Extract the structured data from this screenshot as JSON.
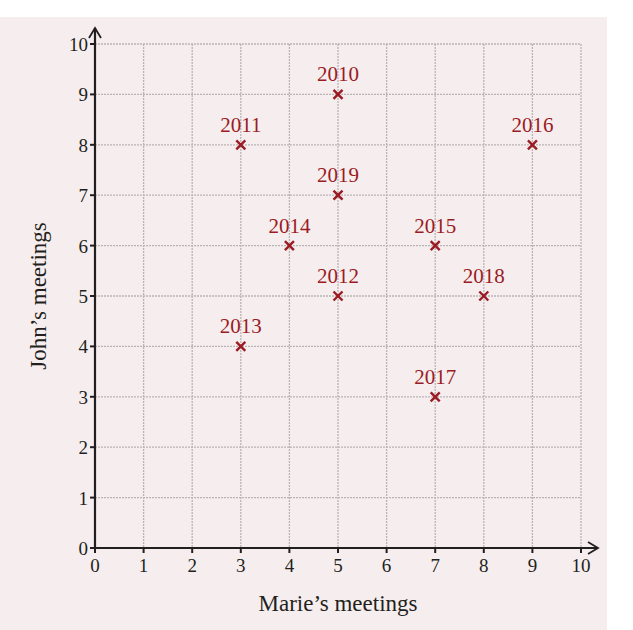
{
  "chart_data": {
    "type": "scatter",
    "title": "",
    "xlabel": "Marie’s meetings",
    "ylabel": "John’s meetings",
    "xlim": [
      0,
      10
    ],
    "ylim": [
      0,
      10
    ],
    "xticks": [
      0,
      1,
      2,
      3,
      4,
      5,
      6,
      7,
      8,
      9,
      10
    ],
    "yticks": [
      0,
      1,
      2,
      3,
      4,
      5,
      6,
      7,
      8,
      9,
      10
    ],
    "grid": true,
    "marker": "x",
    "marker_color": "#9b1b24",
    "points": [
      {
        "label": "2010",
        "x": 5,
        "y": 9
      },
      {
        "label": "2011",
        "x": 3,
        "y": 8
      },
      {
        "label": "2012",
        "x": 5,
        "y": 5
      },
      {
        "label": "2013",
        "x": 3,
        "y": 4
      },
      {
        "label": "2014",
        "x": 4,
        "y": 6
      },
      {
        "label": "2015",
        "x": 7,
        "y": 6
      },
      {
        "label": "2016",
        "x": 9,
        "y": 8
      },
      {
        "label": "2017",
        "x": 7,
        "y": 3
      },
      {
        "label": "2018",
        "x": 8,
        "y": 5
      },
      {
        "label": "2019",
        "x": 5,
        "y": 7
      }
    ]
  },
  "colors": {
    "background": "#f6eeee",
    "grid": "#b9b4b4",
    "axis": "#231f20",
    "marker": "#9b1b24"
  }
}
